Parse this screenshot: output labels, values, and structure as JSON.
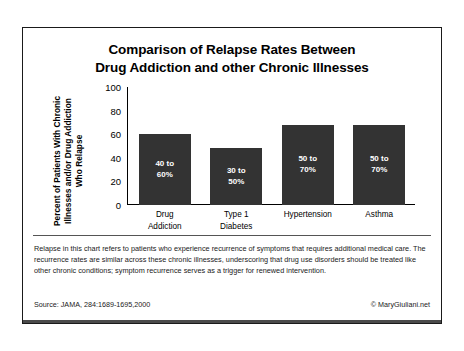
{
  "title": {
    "line1": "Comparison of Relapse Rates Between",
    "line2": "Drug Addiction and other Chronic Illnesses"
  },
  "axis": {
    "y_label_line1": "Percent of Patients With Chronic",
    "y_label_line2": "Illnesses and/or Drug Addiction",
    "y_label_line3": "Who Relapse"
  },
  "caption": {
    "text": "Relapse in this chart refers to patients who experience recurrence of symptoms that requires additional medical care. The recurrence rates are similar across these chronic illnesses, underscoring that drug use disorders should be treated like other chronic conditions; symptom recurrence serves as a trigger for renewed intervention."
  },
  "footer": {
    "source": "Source: JAMA, 284:1689-1695,2000",
    "copyright": "© MaryGiuliani.net"
  },
  "chart_data": {
    "type": "bar",
    "title": "Comparison of Relapse Rates Between Drug Addiction and other Chronic Illnesses",
    "xlabel": "",
    "ylabel": "Percent of Patients With Chronic Illnesses and/or Drug Addiction Who Relapse",
    "ylim": [
      0,
      100
    ],
    "yticks": [
      100,
      80,
      60,
      40,
      20,
      0
    ],
    "ytick_labels": [
      "100",
      "80",
      "60",
      "40",
      "20",
      "0"
    ],
    "grid": false,
    "legend": "none",
    "bar_color": "#333333",
    "categories": [
      "Drug Addiction",
      "Type 1 Diabetes",
      "Hypertension",
      "Asthma"
    ],
    "category_lines": [
      [
        "Drug",
        "Addiction"
      ],
      [
        "Type 1",
        "Diabetes"
      ],
      [
        "Hypertension"
      ],
      [
        "Asthma"
      ]
    ],
    "values": [
      60,
      48,
      68,
      68
    ],
    "data_labels": [
      "40 to 60%",
      "30 to 50%",
      "50 to 70%",
      "50 to 70%"
    ],
    "data_label_lines": [
      [
        "40 to",
        "60%"
      ],
      [
        "30 to",
        "50%"
      ],
      [
        "50 to",
        "70%"
      ],
      [
        "50 to",
        "70%"
      ]
    ],
    "ranges": [
      {
        "category": "Drug Addiction",
        "low": 40,
        "high": 60
      },
      {
        "category": "Type 1 Diabetes",
        "low": 30,
        "high": 50
      },
      {
        "category": "Hypertension",
        "low": 50,
        "high": 70
      },
      {
        "category": "Asthma",
        "low": 50,
        "high": 70
      }
    ]
  }
}
